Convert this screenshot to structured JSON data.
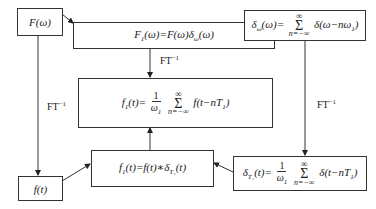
{
  "diagram": {
    "nodes": {
      "F_omega": {
        "label": "F(ω)"
      },
      "F1_omega": {
        "label": "F₁(ω)=F(ω)δω(ω)",
        "lhs": "F",
        "lhs_sub": "1",
        "arg": "(ω)=F(ω)δ",
        "sub2": "ω",
        "tail": "(ω)"
      },
      "delta_omega": {
        "label": "δω(ω)=Σ δ(ω−nω₁)",
        "lhs": "δ",
        "lhs_sub": "ω",
        "arg": "(ω)=",
        "sum_top": "∞",
        "sum_sym": "Σ",
        "sum_bot": "n=−∞",
        "body": "δ(ω−nω",
        "body_sub": "1",
        "body_tail": ")"
      },
      "f1_sum": {
        "label": "f₁(t)=1/ω₁ Σ f(t−nT₁)",
        "lhs": "f",
        "lhs_sub": "1",
        "arg": "(t)=",
        "num": "1",
        "den": "ω",
        "den_sub": "1",
        "sum_top": "∞",
        "sum_sym": "Σ",
        "sum_bot": "n=−∞",
        "body": "f(t−nT",
        "body_sub": "1",
        "body_tail": ")"
      },
      "f_t": {
        "label": "f(t)"
      },
      "f1_conv": {
        "label": "f₁(t)=f(t)*δT₁(t)",
        "lhs": "f",
        "lhs_sub": "1",
        "arg": "(t)=f(t)∗δ",
        "sub2": "T₁",
        "tail": "(t)"
      },
      "delta_T1": {
        "label": "δT₁(t)=1/ω₁ Σ δ(t−nT₁)",
        "lhs": "δ",
        "lhs_sub": "T₁",
        "arg": "(t)=",
        "num": "1",
        "den": "ω",
        "den_sub": "1",
        "sum_top": "∞",
        "sum_sym": "Σ",
        "sum_bot": "n=−∞",
        "body": "δ(t−nT",
        "body_sub": "1",
        "body_tail": ")"
      }
    },
    "edge_labels": {
      "center": "FT",
      "left": "FT",
      "right": "FT",
      "sup": "−1"
    },
    "edges": [
      {
        "from": "F_omega",
        "to": "F1_omega"
      },
      {
        "from": "delta_omega",
        "to": "F1_omega"
      },
      {
        "from": "F1_omega",
        "to": "f1_sum",
        "label": "FT⁻¹"
      },
      {
        "from": "F_omega",
        "to": "f_t",
        "label": "FT⁻¹"
      },
      {
        "from": "delta_omega",
        "to": "delta_T1",
        "label": "FT⁻¹"
      },
      {
        "from": "f_t",
        "to": "f1_conv"
      },
      {
        "from": "delta_T1",
        "to": "f1_conv"
      },
      {
        "from": "f1_conv",
        "to": "f1_sum"
      }
    ]
  }
}
